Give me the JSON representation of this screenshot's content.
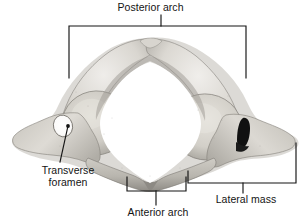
{
  "figure": {
    "background_color": "#ffffff",
    "annotation_color": "#141414",
    "bone_light": "#e9e7e2",
    "bone_mid": "#c9c6bf",
    "bone_dark": "#9d9a93",
    "shadow": "#6e6b66",
    "foramen_dark": "#111111"
  },
  "labels": {
    "posterior_arch": "Posterior arch",
    "transverse_foramen_line1": "Transverse",
    "transverse_foramen_line2": "foramen",
    "anterior_arch": "Anterior arch",
    "lateral_mass": "Lateral mass"
  },
  "annotations": [
    {
      "name": "posterior-arch",
      "text": "Posterior arch",
      "type": "bracket",
      "orientation": "top",
      "span": [
        69,
        246
      ],
      "rail_y": 26,
      "arm_end_y": 78,
      "stem_x": 161,
      "stem_from_y": 15,
      "stem_to_y": 26
    },
    {
      "name": "transverse-foramen",
      "text": "Transverse foramen",
      "type": "leader-line",
      "tip": [
        68,
        125
      ],
      "elbow": [
        60,
        160
      ]
    },
    {
      "name": "anterior-arch",
      "text": "Anterior arch",
      "type": "bracket",
      "orientation": "bottom",
      "span": [
        127,
        186
      ],
      "rail_y": 191,
      "arm_end_y": 177,
      "stem_x": 156,
      "stem_from_y": 191,
      "stem_to_y": 204
    },
    {
      "name": "lateral-mass",
      "type": "bracket",
      "text": "Lateral mass",
      "orientation": "bottom",
      "span": [
        188,
        296
      ],
      "rail_y": 183,
      "left_arm_end_y": 171,
      "right_arm_end_y": 143,
      "stem_x": 243,
      "stem_from_y": 183,
      "stem_to_y": 192
    }
  ],
  "anatomy_parts": [
    {
      "name": "posterior-arch",
      "description": "curved upper ring of the atlas"
    },
    {
      "name": "posterior-tubercle",
      "description": "small notch at top center of posterior arch"
    },
    {
      "name": "vertebral-foramen",
      "description": "large central opening"
    },
    {
      "name": "left-lateral-mass",
      "description": "oval articular facet left of center"
    },
    {
      "name": "right-lateral-mass",
      "description": "oval articular facet right of center"
    },
    {
      "name": "left-transverse-process",
      "description": "lateral wing extending to the left"
    },
    {
      "name": "right-transverse-process",
      "description": "lateral wing extending to the right"
    },
    {
      "name": "left-transverse-foramen",
      "description": "light opening in left transverse process"
    },
    {
      "name": "right-transverse-foramen",
      "description": "dark opening in right transverse process"
    },
    {
      "name": "anterior-arch",
      "description": "lower bar of the atlas ring with anterior tubercle"
    }
  ]
}
